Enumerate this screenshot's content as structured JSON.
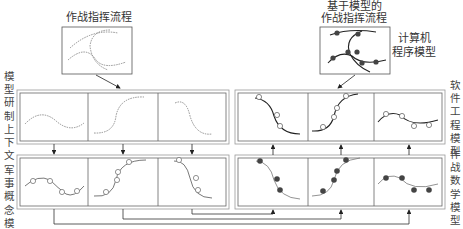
{
  "diagram": {
    "left_top": {
      "title": "作战指挥流程"
    },
    "right_top": {
      "title_line1": "基于模型的",
      "title_line2": "作战指挥流程",
      "side_label_line1": "计算机",
      "side_label_line2": "程序模型"
    },
    "left_labels": {
      "upper": "模型研制上下文",
      "lower": "军事概念模型"
    },
    "right_labels": {
      "upper": "软件工程模型",
      "lower": "作战数学模型"
    },
    "panels": {
      "left_upper": [
        "dashed wave",
        "dashed S-rise",
        "dashed S-fall"
      ],
      "left_lower": [
        "wave with hollow nodes",
        "S-rise with hollow nodes",
        "S-fall with hollow nodes"
      ],
      "right_upper": [
        "solid S-fall with hollow nodes",
        "solid S-rise with hollow nodes",
        "solid wave with hollow nodes"
      ],
      "right_lower": [
        "S-fall with filled nodes",
        "S-rise with filled nodes",
        "wave with filled nodes"
      ]
    },
    "colors": {
      "line": "#333333",
      "dashed": "#777777",
      "frame": "#888888",
      "filled_node": "#444444",
      "hollow_node": "#ffffff"
    }
  }
}
